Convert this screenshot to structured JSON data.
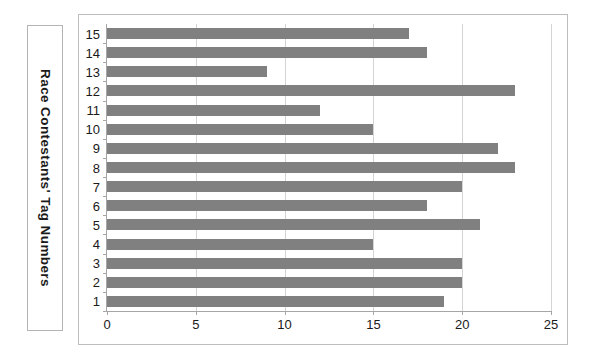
{
  "chart_data": {
    "type": "bar",
    "orientation": "horizontal",
    "title": "",
    "xlabel": "",
    "ylabel": "Race Contestants' Tag Numbers",
    "categories": [
      "1",
      "2",
      "3",
      "4",
      "5",
      "6",
      "7",
      "8",
      "9",
      "10",
      "11",
      "12",
      "13",
      "14",
      "15"
    ],
    "values": [
      19,
      20,
      20,
      15,
      21,
      18,
      20,
      23,
      22,
      15,
      12,
      23,
      9,
      18,
      17
    ],
    "xlim": [
      0,
      25
    ],
    "xticks": [
      0,
      5,
      10,
      15,
      20,
      25
    ],
    "xtick_labels": [
      "0",
      "5",
      "10",
      "15",
      "20",
      "25"
    ],
    "grid": "vertical",
    "legend": "none",
    "bar_color": "#808080",
    "gridline_color": "#d4d4d4",
    "axis_color": "#a6a6a6",
    "background": "#ffffff"
  }
}
